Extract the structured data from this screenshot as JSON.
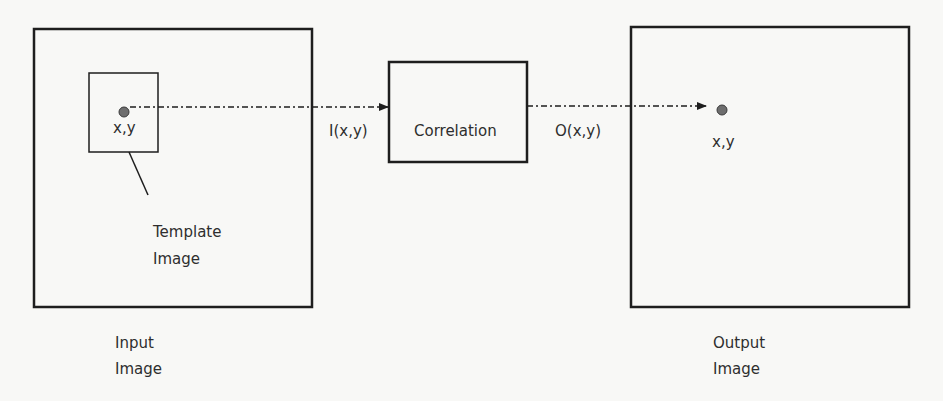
{
  "diagram": {
    "input_box": {
      "label_line1": "Input",
      "label_line2": "Image"
    },
    "template_box": {
      "label_line1": "Template",
      "label_line2": "Image",
      "point_label": "x,y"
    },
    "input_signal_label": "I(x,y)",
    "correlation_box": {
      "label": "Correlation"
    },
    "output_signal_label": "O(x,y)",
    "output_box": {
      "label_line1": "Output",
      "label_line2": "Image",
      "point_label": "x,y"
    },
    "colors": {
      "stroke": "#1e1e1e",
      "point": "#6e6e6e",
      "text": "#2e2e2e",
      "background": "#f8f8f6"
    }
  }
}
